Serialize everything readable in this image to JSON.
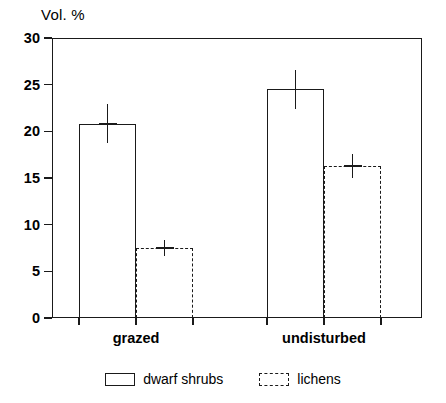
{
  "chart_data": {
    "type": "bar",
    "title": "",
    "subtitle": "",
    "xlabel": "",
    "ylabel": "Vol. %",
    "ylim": [
      0,
      30
    ],
    "yticks": [
      0,
      5,
      10,
      15,
      20,
      25,
      30
    ],
    "ytick_labels": [
      "0",
      "5",
      "10",
      "15",
      "20",
      "25",
      "30"
    ],
    "categories": [
      "grazed",
      "undisturbed"
    ],
    "grid": false,
    "legend_position": "bottom-center",
    "series": [
      {
        "name": "dwarf shrubs",
        "style": "solid",
        "values": [
          20.8,
          24.5
        ],
        "errors": [
          2.1,
          2.1
        ]
      },
      {
        "name": "lichens",
        "style": "dashed",
        "values": [
          7.5,
          16.3
        ],
        "errors": [
          0.9,
          1.3
        ]
      }
    ]
  },
  "axis": {
    "y_title": "Vol. %"
  },
  "legend": {
    "items": [
      {
        "label": "dwarf shrubs",
        "style": "solid"
      },
      {
        "label": "lichens",
        "style": "dashed"
      }
    ]
  }
}
